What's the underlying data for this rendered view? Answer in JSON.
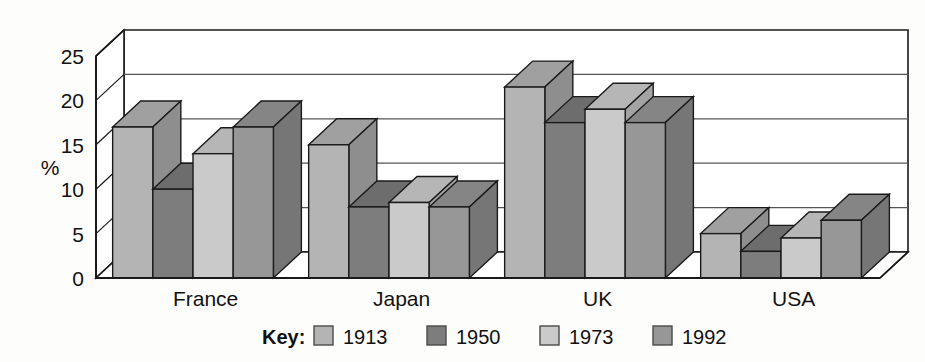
{
  "chart_data": {
    "type": "bar",
    "title": "",
    "xlabel": "",
    "ylabel": "%",
    "ylim": [
      0,
      25
    ],
    "yticks": [
      0,
      5,
      10,
      15,
      20,
      25
    ],
    "ytick_labels": [
      "0",
      "5",
      "10",
      "15",
      "20",
      "25"
    ],
    "grid": true,
    "legend_position": "bottom",
    "legend_title": "Key:",
    "style": "3d-grouped-bar",
    "categories": [
      "France",
      "Japan",
      "UK",
      "USA"
    ],
    "series": [
      {
        "name": "1913",
        "color": "#b4b4b4",
        "side_color": "#8e8e8e",
        "top_color": "#a0a0a0",
        "values": [
          17.0,
          15.0,
          21.5,
          5.0
        ]
      },
      {
        "name": "1950",
        "color": "#7d7d7d",
        "side_color": "#616161",
        "top_color": "#6d6d6d",
        "values": [
          10.0,
          8.0,
          17.5,
          3.0
        ]
      },
      {
        "name": "1973",
        "color": "#cacaca",
        "side_color": "#a3a3a3",
        "top_color": "#b6b6b6",
        "values": [
          14.0,
          8.5,
          19.0,
          4.5
        ]
      },
      {
        "name": "1992",
        "color": "#979797",
        "side_color": "#767676",
        "top_color": "#858585",
        "values": [
          17.0,
          8.0,
          17.5,
          6.5
        ]
      }
    ]
  },
  "legend": {
    "key_label": "Key:",
    "entries": [
      {
        "label": "1913",
        "color": "#b4b4b4"
      },
      {
        "label": "1950",
        "color": "#7d7d7d"
      },
      {
        "label": "1973",
        "color": "#cacaca"
      },
      {
        "label": "1992",
        "color": "#979797"
      }
    ]
  },
  "axes": {
    "y_axis_title": "%",
    "y_tick_labels": [
      "25",
      "20",
      "15",
      "10",
      "5",
      "0"
    ],
    "x_tick_labels": [
      "France",
      "Japan",
      "UK",
      "USA"
    ]
  },
  "colors": {
    "background": "#fdfdfb",
    "line": "#1a1a1a",
    "gridline": "#555555",
    "wall": "#ffffff",
    "floor": "#ffffff"
  }
}
